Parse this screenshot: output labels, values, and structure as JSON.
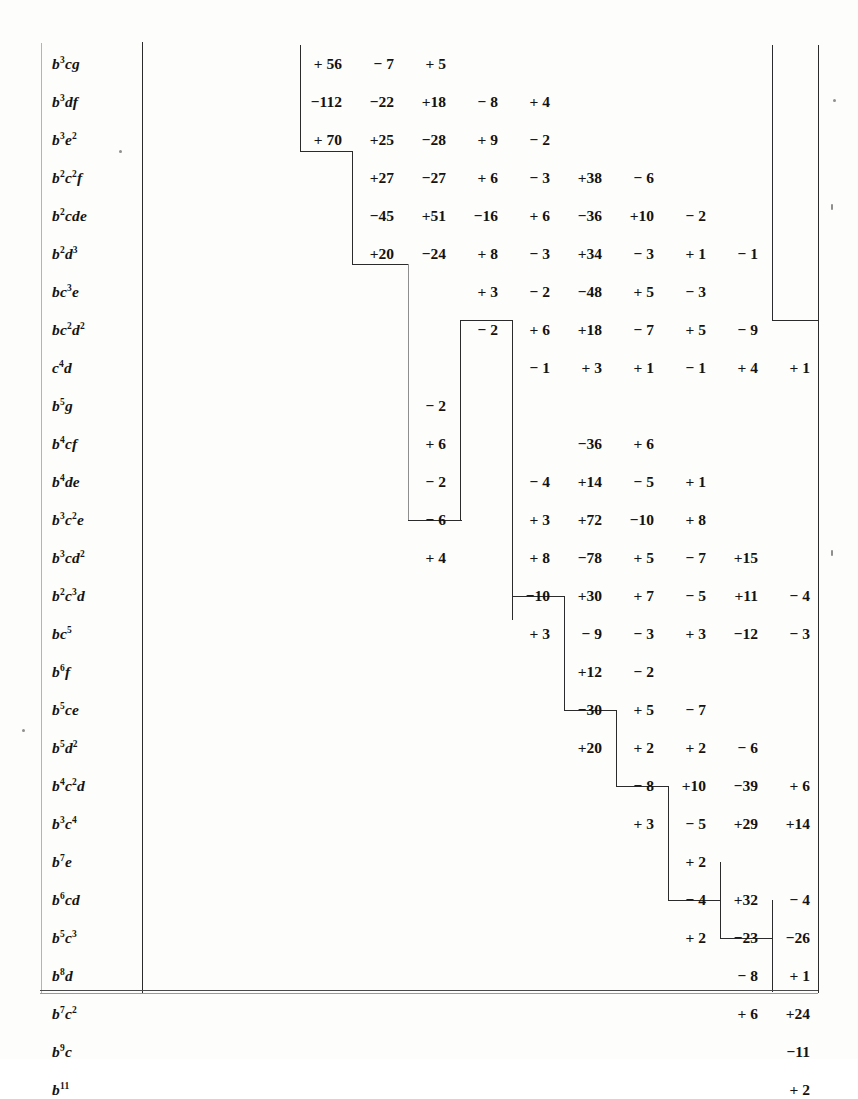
{
  "document": {
    "kind": "mathematical-numeric-table",
    "description": "Staircase-shaped table of integer coefficients indexed by weight-11 monomials in b,c,d,e,f,g",
    "label_column_header": "",
    "total_rows": 28,
    "total_columns": 11
  },
  "columns": [
    {
      "index": 0,
      "x": 300
    },
    {
      "index": 1,
      "x": 352
    },
    {
      "index": 2,
      "x": 404
    },
    {
      "index": 3,
      "x": 456
    },
    {
      "index": 4,
      "x": 508
    },
    {
      "index": 5,
      "x": 560
    },
    {
      "index": 6,
      "x": 612
    },
    {
      "index": 7,
      "x": 664
    },
    {
      "index": 8,
      "x": 716
    },
    {
      "index": 9,
      "x": 768
    },
    {
      "index": 10,
      "x": 806
    }
  ],
  "rows": [
    {
      "label_base": "b",
      "label_parts": [
        [
          "b",
          "3"
        ],
        [
          "c",
          ""
        ],
        [
          "g",
          ""
        ]
      ],
      "label_text": "b3cg",
      "start": 0,
      "values": [
        "+ 56",
        "− 7",
        "+ 5"
      ]
    },
    {
      "label_base": "b",
      "label_parts": [
        [
          "b",
          "3"
        ],
        [
          "d",
          ""
        ],
        [
          "f",
          ""
        ]
      ],
      "label_text": "b3df",
      "start": 0,
      "values": [
        "−112",
        "−22",
        "+18",
        "− 8",
        "+ 4"
      ]
    },
    {
      "label_base": "b",
      "label_parts": [
        [
          "b",
          "3"
        ],
        [
          "e",
          "2"
        ]
      ],
      "label_text": "b3e2",
      "start": 0,
      "values": [
        "+ 70",
        "+25",
        "−28",
        "+ 9",
        "− 2"
      ]
    },
    {
      "label_base": "b",
      "label_parts": [
        [
          "b",
          "2"
        ],
        [
          "c",
          "2"
        ],
        [
          "f",
          ""
        ]
      ],
      "label_text": "b2c2f",
      "start": 1,
      "values": [
        "+27",
        "−27",
        "+ 6",
        "− 3",
        "+38",
        "− 6"
      ]
    },
    {
      "label_base": "b",
      "label_parts": [
        [
          "b",
          "2"
        ],
        [
          "c",
          ""
        ],
        [
          "d",
          ""
        ],
        [
          "e",
          ""
        ]
      ],
      "label_text": "b2cde",
      "start": 1,
      "values": [
        "−45",
        "+51",
        "−16",
        "+ 6",
        "−36",
        "+10",
        "− 2"
      ]
    },
    {
      "label_base": "b",
      "label_parts": [
        [
          "b",
          "2"
        ],
        [
          "d",
          "3"
        ]
      ],
      "label_text": "b2d3",
      "start": 1,
      "values": [
        "+20",
        "−24",
        "+ 8",
        "− 3",
        "+34",
        "− 3",
        "+ 1",
        "− 1"
      ]
    },
    {
      "label_base": "b",
      "label_parts": [
        [
          "b",
          ""
        ],
        [
          "c",
          "3"
        ],
        [
          "e",
          ""
        ]
      ],
      "label_text": "bc3e",
      "start": 3,
      "values": [
        "+ 3",
        "− 2",
        "−48",
        "+ 5",
        "− 3"
      ]
    },
    {
      "label_base": "b",
      "label_parts": [
        [
          "b",
          ""
        ],
        [
          "c",
          "2"
        ],
        [
          "d",
          "2"
        ]
      ],
      "label_text": "bc2d2",
      "start": 3,
      "values": [
        "− 2",
        "+ 6",
        "+18",
        "− 7",
        "+ 5",
        "− 9"
      ]
    },
    {
      "label_base": "c",
      "label_parts": [
        [
          "c",
          "4"
        ],
        [
          "d",
          ""
        ]
      ],
      "label_text": "c4d",
      "start": 4,
      "values": [
        "− 1",
        "+ 3",
        "+ 1",
        "− 1",
        "+ 4",
        "+ 1"
      ]
    },
    {
      "label_base": "b",
      "label_parts": [
        [
          "b",
          "5"
        ],
        [
          "g",
          ""
        ]
      ],
      "label_text": "b5g",
      "start": 2,
      "values": [
        "− 2"
      ]
    },
    {
      "label_base": "b",
      "label_parts": [
        [
          "b",
          "4"
        ],
        [
          "c",
          ""
        ],
        [
          "f",
          ""
        ]
      ],
      "label_text": "b4cf",
      "start": 2,
      "values": [
        "+ 6",
        "",
        "",
        "−36",
        "+ 6"
      ]
    },
    {
      "label_base": "b",
      "label_parts": [
        [
          "b",
          "4"
        ],
        [
          "d",
          ""
        ],
        [
          "e",
          ""
        ]
      ],
      "label_text": "b4de",
      "start": 2,
      "values": [
        "− 2",
        "",
        "− 4",
        "+14",
        "− 5",
        "+ 1"
      ]
    },
    {
      "label_base": "b",
      "label_parts": [
        [
          "b",
          "3"
        ],
        [
          "c",
          "2"
        ],
        [
          "e",
          ""
        ]
      ],
      "label_text": "b3c2e",
      "start": 2,
      "values": [
        "− 6",
        "",
        "+ 3",
        "+72",
        "−10",
        "+ 8"
      ]
    },
    {
      "label_base": "b",
      "label_parts": [
        [
          "b",
          "3"
        ],
        [
          "c",
          ""
        ],
        [
          "d",
          "2"
        ]
      ],
      "label_text": "b3cd2",
      "start": 2,
      "values": [
        "+ 4",
        "",
        "+ 8",
        "−78",
        "+ 5",
        "− 7",
        "+15"
      ]
    },
    {
      "label_base": "b",
      "label_parts": [
        [
          "b",
          "2"
        ],
        [
          "c",
          "3"
        ],
        [
          "d",
          ""
        ]
      ],
      "label_text": "b2c3d",
      "start": 4,
      "values": [
        "−10",
        "+30",
        "+ 7",
        "− 5",
        "+11",
        "− 4"
      ]
    },
    {
      "label_base": "b",
      "label_parts": [
        [
          "b",
          ""
        ],
        [
          "c",
          "5"
        ]
      ],
      "label_text": "bc5",
      "start": 4,
      "values": [
        "+ 3",
        "− 9",
        "− 3",
        "+ 3",
        "−12",
        "− 3"
      ]
    },
    {
      "label_base": "b",
      "label_parts": [
        [
          "b",
          "6"
        ],
        [
          "f",
          ""
        ]
      ],
      "label_text": "b6f",
      "start": 5,
      "values": [
        "+12",
        "− 2"
      ]
    },
    {
      "label_base": "b",
      "label_parts": [
        [
          "b",
          "5"
        ],
        [
          "c",
          ""
        ],
        [
          "e",
          ""
        ]
      ],
      "label_text": "b5ce",
      "start": 5,
      "values": [
        "−30",
        "+ 5",
        "− 7"
      ]
    },
    {
      "label_base": "b",
      "label_parts": [
        [
          "b",
          "5"
        ],
        [
          "d",
          "2"
        ]
      ],
      "label_text": "b5d2",
      "start": 5,
      "values": [
        "+20",
        "+ 2",
        "+ 2",
        "− 6"
      ]
    },
    {
      "label_base": "b",
      "label_parts": [
        [
          "b",
          "4"
        ],
        [
          "c",
          "2"
        ],
        [
          "d",
          ""
        ]
      ],
      "label_text": "b4c2d",
      "start": 6,
      "values": [
        "− 8",
        "+10",
        "−39",
        "+ 6"
      ]
    },
    {
      "label_base": "b",
      "label_parts": [
        [
          "b",
          "3"
        ],
        [
          "c",
          "4"
        ]
      ],
      "label_text": "b3c4",
      "start": 6,
      "values": [
        "+ 3",
        "− 5",
        "+29",
        "+14"
      ]
    },
    {
      "label_base": "b",
      "label_parts": [
        [
          "b",
          "7"
        ],
        [
          "e",
          ""
        ]
      ],
      "label_text": "b7e",
      "start": 7,
      "values": [
        "+ 2"
      ]
    },
    {
      "label_base": "b",
      "label_parts": [
        [
          "b",
          "6"
        ],
        [
          "c",
          ""
        ],
        [
          "d",
          ""
        ]
      ],
      "label_text": "b6cd",
      "start": 7,
      "values": [
        "− 4",
        "+32",
        "− 4"
      ]
    },
    {
      "label_base": "b",
      "label_parts": [
        [
          "b",
          "5"
        ],
        [
          "c",
          "3"
        ]
      ],
      "label_text": "b5c3",
      "start": 7,
      "values": [
        "+ 2",
        "−23",
        "−26"
      ]
    },
    {
      "label_base": "b",
      "label_parts": [
        [
          "b",
          "8"
        ],
        [
          "d",
          ""
        ]
      ],
      "label_text": "b8d",
      "start": 8,
      "values": [
        "− 8",
        "+ 1"
      ]
    },
    {
      "label_base": "b",
      "label_parts": [
        [
          "b",
          "7"
        ],
        [
          "c",
          "2"
        ]
      ],
      "label_text": "b7c2",
      "start": 8,
      "values": [
        "+ 6",
        "+24"
      ]
    },
    {
      "label_base": "b",
      "label_parts": [
        [
          "b",
          "9"
        ],
        [
          "c",
          ""
        ]
      ],
      "label_text": "b9c",
      "start": 9,
      "values": [
        "−11"
      ]
    },
    {
      "label_base": "b",
      "label_parts": [
        [
          "b",
          "11"
        ]
      ],
      "label_text": "b11",
      "start": 9,
      "values": [
        "+ 2"
      ]
    }
  ],
  "staircase": {
    "note": "nested rectangular brackets delimiting the blocks of the triangular array"
  }
}
